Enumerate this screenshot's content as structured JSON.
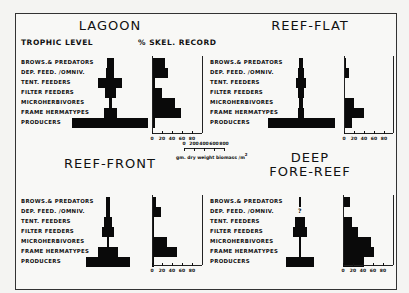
{
  "headers": {
    "trophic_level": "TROPHIC LEVEL",
    "skel_record": "% SKEL. RECORD"
  },
  "scale": {
    "ticks": [
      "0",
      "200",
      "400",
      "600",
      "800"
    ],
    "unit": "gm. dry weight biomass /m",
    "unit_sup": "2"
  },
  "trophic_levels": [
    "BROWS.& PREDATORS",
    "DEP. FEED. /OMNIV.",
    "TENT. FEEDERS",
    "FILTER FEEDERS",
    "MICROHERBIVORES",
    "FRAME HERMATYPES",
    "PRODUCERS"
  ],
  "skel_ticks": [
    "0",
    "20",
    "40",
    "60",
    "80"
  ],
  "panels": [
    {
      "id": "lagoon",
      "title": "LAGOON",
      "title2": ""
    },
    {
      "id": "reef-flat",
      "title": "REEF-FLAT",
      "title2": ""
    },
    {
      "id": "reef-front",
      "title": "REEF-FRONT",
      "title2": ""
    },
    {
      "id": "deep-fore-reef",
      "title": "DEEP",
      "title2": "FORE-REEF"
    }
  ],
  "unknown_marker": "?",
  "chart_data": [
    {
      "type": "bar",
      "title": "LAGOON",
      "categories": [
        "Browsers & Predators",
        "Dep. Feed./Omniv.",
        "Tent. Feeders",
        "Filter Feeders",
        "Microherbivores",
        "Frame Hermatypes",
        "Producers"
      ],
      "series": [
        {
          "name": "Biomass (gm dry weight/m2, pyramid width)",
          "values": [
            70,
            75,
            240,
            110,
            30,
            130,
            760
          ]
        },
        {
          "name": "% Skel. Record",
          "values": [
            25,
            32,
            5,
            20,
            45,
            58,
            6
          ]
        }
      ],
      "xlabel": "% SKEL. RECORD",
      "ylabel": "TROPHIC LEVEL",
      "xlim": [
        0,
        80
      ]
    },
    {
      "type": "bar",
      "title": "REEF-FLAT",
      "categories": [
        "Browsers & Predators",
        "Dep. Feed./Omniv.",
        "Tent. Feeders",
        "Filter Feeders",
        "Microherbivores",
        "Frame Hermatypes",
        "Producers"
      ],
      "series": [
        {
          "name": "Biomass (gm dry weight/m2, pyramid width)",
          "values": [
            40,
            60,
            100,
            60,
            40,
            60,
            670
          ]
        },
        {
          "name": "% Skel. Record",
          "values": [
            4,
            10,
            0,
            0,
            20,
            40,
            15
          ]
        }
      ],
      "xlabel": "% SKEL. RECORD",
      "ylabel": "TROPHIC LEVEL",
      "xlim": [
        0,
        80
      ]
    },
    {
      "type": "bar",
      "title": "REEF-FRONT",
      "categories": [
        "Browsers & Predators",
        "Dep. Feed./Omniv.",
        "Tent. Feeders",
        "Filter Feeders",
        "Microherbivores",
        "Frame Hermatypes",
        "Producers"
      ],
      "series": [
        {
          "name": "Biomass (gm dry weight/m2, pyramid width)",
          "values": [
            40,
            40,
            80,
            120,
            20,
            200,
            440
          ]
        },
        {
          "name": "% Skel. Record",
          "values": [
            8,
            18,
            4,
            4,
            30,
            50,
            4
          ]
        }
      ],
      "xlabel": "% SKEL. RECORD",
      "ylabel": "TROPHIC LEVEL",
      "xlim": [
        0,
        80
      ]
    },
    {
      "type": "bar",
      "title": "DEEP FORE-REEF",
      "categories": [
        "Browsers & Predators",
        "Dep. Feed./Omniv.",
        "Tent. Feeders",
        "Filter Feeders",
        "Microherbivores",
        "Frame Hermatypes",
        "Producers"
      ],
      "series": [
        {
          "name": "Biomass (gm dry weight/m2, pyramid width)",
          "values": [
            20,
            null,
            100,
            140,
            20,
            20,
            280
          ]
        },
        {
          "name": "% Skel. Record",
          "values": [
            14,
            0,
            18,
            30,
            55,
            62,
            42
          ]
        }
      ],
      "xlabel": "% SKEL. RECORD",
      "ylabel": "TROPHIC LEVEL",
      "xlim": [
        0,
        80
      ],
      "annotations": [
        "? marks unknown Dep. Feed./Omniv. biomass"
      ]
    }
  ]
}
